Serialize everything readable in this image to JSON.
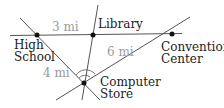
{
  "diagram": {
    "colors": {
      "line": "#555555",
      "point": "#111111",
      "label": "#222222",
      "distance": "#9a9a9a"
    },
    "locations": [
      {
        "id": "high-school",
        "name_line1": "High",
        "name_line2": "School",
        "x": 37,
        "y": 35
      },
      {
        "id": "library",
        "name_line1": "Library",
        "name_line2": "",
        "x": 93,
        "y": 35
      },
      {
        "id": "convention-center",
        "name_line1": "Convention",
        "name_line2": "Center",
        "x": 172,
        "y": 34
      },
      {
        "id": "computer-store",
        "name_line1": "Computer",
        "name_line2": "Store",
        "x": 84,
        "y": 83
      }
    ],
    "distances": [
      {
        "from": "high-school",
        "to": "library",
        "label": "3 mi"
      },
      {
        "from": "high-school",
        "to": "computer-store",
        "label": "4 mi"
      },
      {
        "from": "computer-store",
        "to": "convention-center",
        "label": "6 mi"
      }
    ]
  }
}
